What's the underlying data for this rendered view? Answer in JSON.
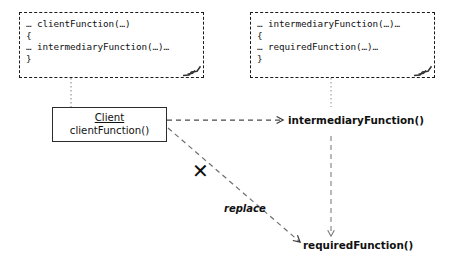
{
  "diagram": {
    "colors": {
      "stroke": "#1a1a1a",
      "box_stroke": "#2b2b2b",
      "connector": "#555555",
      "background": "#ffffff",
      "text": "#111111"
    },
    "notes": [
      {
        "id": "client-code-note",
        "lines": [
          "… clientFunction(…)",
          "{",
          "… intermediaryFunction(…)…",
          "}"
        ]
      },
      {
        "id": "intermediary-code-note",
        "lines": [
          "… intermediaryFunction(…)…",
          "{",
          "… requiredFunction(…)…",
          "}"
        ]
      }
    ],
    "class_box": {
      "name": "Client",
      "members": [
        "clientFunction()"
      ]
    },
    "operations": [
      {
        "id": "intermediary-operation",
        "label": "intermediaryFunction()"
      },
      {
        "id": "required-operation",
        "label": "requiredFunction()"
      }
    ],
    "edge_labels": [
      {
        "id": "replace-label",
        "label": "replace"
      }
    ],
    "markers": [
      {
        "id": "cross-out-marker",
        "glyph": "✕"
      }
    ]
  }
}
